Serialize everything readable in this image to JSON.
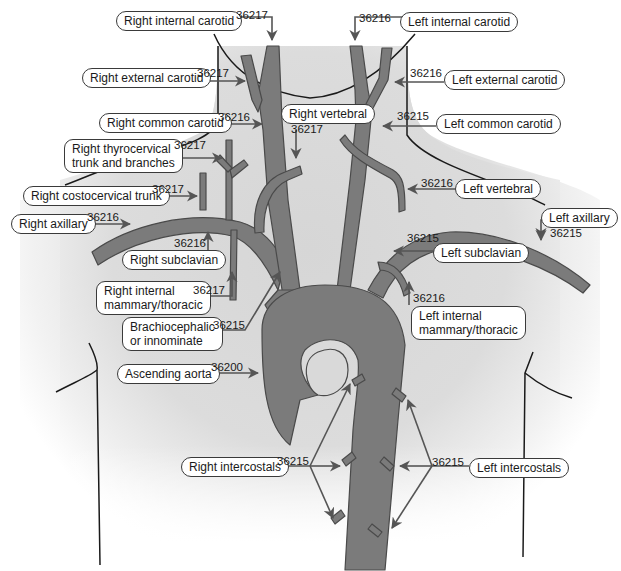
{
  "colors": {
    "vessel": "#7b7b7b",
    "vessel_outline": "#4a4a4a",
    "body_fill": "#d9d9d9",
    "outline": "#1a1a1a",
    "pointer": "#555555"
  },
  "labels": [
    {
      "id": "right-internal-carotid",
      "text": "Right internal carotid",
      "code": "36217",
      "x": 116,
      "y": 12,
      "cx": 264,
      "cy": 14
    },
    {
      "id": "right-external-carotid",
      "text": "Right external carotid",
      "code": "36217",
      "x": 82,
      "y": 68,
      "cx": 198,
      "cy": 70
    },
    {
      "id": "right-common-carotid",
      "text": "Right common carotid",
      "code": "36216",
      "x": 99,
      "y": 113,
      "cx": 218,
      "cy": 113
    },
    {
      "id": "right-thyrocervical",
      "text": "Right thyrocervical\ntrunk and branches",
      "code": "36217",
      "x": 64,
      "y": 139,
      "cx": 174,
      "cy": 141
    },
    {
      "id": "right-costocervical",
      "text": "Right costocervical trunk",
      "code": "36217",
      "x": 23,
      "y": 183,
      "cx": 152,
      "cy": 185
    },
    {
      "id": "right-axillary",
      "text": "Right axillary",
      "code": "36216",
      "x": 11,
      "y": 213,
      "cx": 88,
      "cy": 213
    },
    {
      "id": "right-subclavian",
      "text": "Right subclavian",
      "code": "36216",
      "x": 122,
      "y": 251,
      "cx": 177,
      "cy": 238
    },
    {
      "id": "right-internal-mammary",
      "text": "Right internal\nmammary/thoracic",
      "code": "36217",
      "x": 95,
      "y": 281,
      "cx": 194,
      "cy": 285
    },
    {
      "id": "brachiocephalic",
      "text": "Brachiocephalic\nor innominate",
      "code": "36215",
      "x": 122,
      "y": 316,
      "cx": 213,
      "cy": 322
    },
    {
      "id": "ascending-aorta",
      "text": "Ascending aorta",
      "code": "36200",
      "x": 117,
      "y": 364,
      "cx": 211,
      "cy": 362
    },
    {
      "id": "right-intercostals",
      "text": "Right intercostals",
      "code": "36215",
      "x": 181,
      "y": 456,
      "cx": 276,
      "cy": 458
    },
    {
      "id": "left-internal-carotid",
      "text": "Left internal carotid",
      "code": "36216",
      "x": 400,
      "y": 13,
      "cx": 359,
      "cy": 14
    },
    {
      "id": "left-external-carotid",
      "text": "Left external carotid",
      "code": "36216",
      "x": 444,
      "y": 70,
      "cx": 410,
      "cy": 69
    },
    {
      "id": "left-common-carotid",
      "text": "Left common carotid",
      "code": "36215",
      "x": 436,
      "y": 115,
      "cx": 397,
      "cy": 112
    },
    {
      "id": "right-vertebral",
      "text": "Right vertebral",
      "code": "36217",
      "x": 281,
      "y": 104,
      "cx": 291,
      "cy": 124
    },
    {
      "id": "left-vertebral",
      "text": "Left vertebral",
      "code": "36216",
      "x": 455,
      "y": 179,
      "cx": 421,
      "cy": 177
    },
    {
      "id": "left-axillary",
      "text": "Left axillary",
      "code": "36215",
      "x": 541,
      "y": 208,
      "cx": 550,
      "cy": 227
    },
    {
      "id": "left-subclavian",
      "text": "Left subclavian",
      "code": "36215",
      "x": 433,
      "y": 242,
      "cx": 407,
      "cy": 234
    },
    {
      "id": "left-internal-mammary",
      "text": "Left internal\nmammary/thoracic",
      "code": "36216",
      "x": 411,
      "y": 306,
      "cx": 413,
      "cy": 293
    },
    {
      "id": "left-intercostals",
      "text": "Left intercostals",
      "code": "36215",
      "x": 469,
      "y": 458,
      "cx": 432,
      "cy": 458
    }
  ]
}
